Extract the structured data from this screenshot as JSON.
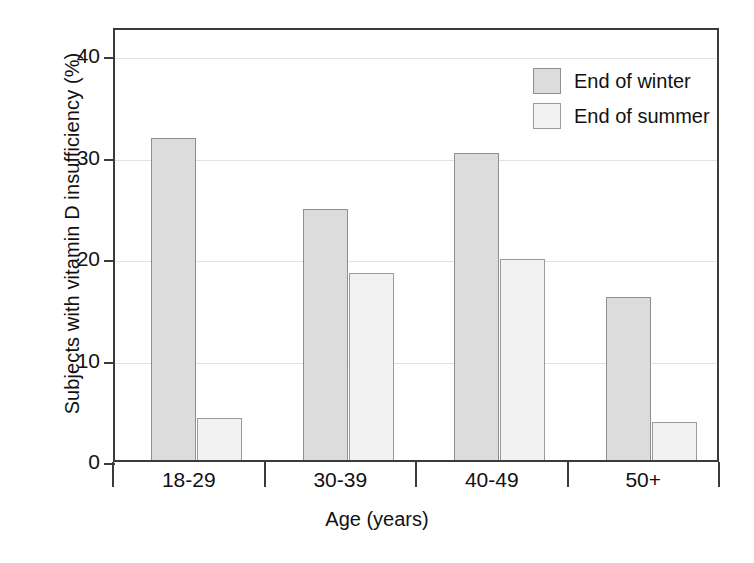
{
  "chart_data": {
    "type": "bar",
    "title": "",
    "xlabel": "Age (years)",
    "ylabel": "Subjects with vitamin D insufficiency (%)",
    "categories": [
      "18-29",
      "30-39",
      "40-49",
      "50+"
    ],
    "series": [
      {
        "name": "End of winter",
        "color": "#dcdcdc",
        "values": [
          31.8,
          24.8,
          30.3,
          16.1
        ]
      },
      {
        "name": "End of summer",
        "color": "#f2f2f2",
        "values": [
          4.1,
          18.4,
          19.8,
          3.7
        ]
      }
    ],
    "ylim": [
      0,
      42.8
    ],
    "yticks": [
      0,
      10,
      20,
      30,
      40
    ],
    "ytick_labels": [
      "0",
      "10",
      "20",
      "30",
      "40"
    ],
    "grid": true,
    "legend_position": "top-right",
    "axis_color": "#3b3b3b",
    "grid_color": "#e2e2e2"
  },
  "legend": {
    "entries": [
      {
        "label": "End of winter"
      },
      {
        "label": "End of summer"
      }
    ]
  }
}
